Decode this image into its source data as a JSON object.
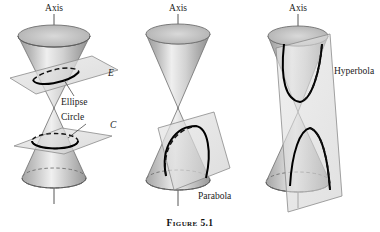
{
  "figure": {
    "caption": "Figure 5.1",
    "background_color": "#ffffff",
    "ink_color": "#1a1a1a",
    "cone_fill_light": "#f2f2f2",
    "cone_fill_mid": "#c9c9c9",
    "cone_fill_dark": "#9a9a9a",
    "plane_fill": "#d8d8d8",
    "curve_color": "#000000"
  },
  "panels": [
    {
      "id": "ellipse-circle",
      "axis_label": "Axis",
      "plane_labels": [
        {
          "id": "plane-E",
          "text": "E"
        },
        {
          "id": "plane-C",
          "text": "C"
        }
      ],
      "curve_labels": [
        {
          "id": "curve-ellipse",
          "text": "Ellipse"
        },
        {
          "id": "curve-circle",
          "text": "Circle"
        }
      ],
      "description": "Double cone cut by two planes: an oblique plane giving an ellipse and a horizontal plane giving a circle"
    },
    {
      "id": "parabola",
      "axis_label": "Axis",
      "plane_labels": [],
      "curve_labels": [
        {
          "id": "curve-parabola",
          "text": "Parabola"
        }
      ],
      "description": "Double cone cut by a plane parallel to a generator giving a parabola"
    },
    {
      "id": "hyperbola",
      "axis_label": "Axis",
      "plane_labels": [],
      "curve_labels": [
        {
          "id": "curve-hyperbola",
          "text": "Hyperbola"
        }
      ],
      "description": "Double cone cut by a near vertical plane meeting both nappes giving a hyperbola"
    }
  ]
}
